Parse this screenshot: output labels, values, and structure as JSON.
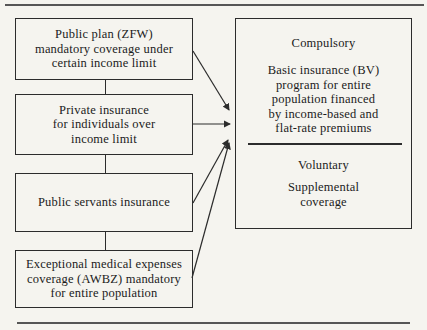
{
  "diagram": {
    "left_boxes": [
      {
        "id": "public-plan-zfw",
        "text": "Public plan (ZFW)\nmandatory coverage under\ncertain income limit"
      },
      {
        "id": "private-insurance",
        "text": "Private insurance\nfor individuals over\nincome limit"
      },
      {
        "id": "public-servants",
        "text": "Public servants insurance"
      },
      {
        "id": "awbz",
        "text": "Exceptional medical expenses\ncoverage (AWBZ) mandatory\nfor entire population"
      }
    ],
    "right_box": {
      "compulsory_label": "Compulsory",
      "compulsory_body": "Basic insurance (BV)\nprogram for entire\npopulation financed\nby income-based and\nflat-rate premiums",
      "voluntary_label": "Voluntary",
      "voluntary_body": "Supplemental\ncoverage"
    },
    "connections": [
      {
        "from": "public-plan-zfw",
        "to": "basic-insurance-bv"
      },
      {
        "from": "private-insurance",
        "to": "basic-insurance-bv"
      },
      {
        "from": "public-servants",
        "to": "basic-insurance-bv"
      },
      {
        "from": "awbz",
        "to": "basic-insurance-bv"
      }
    ],
    "colors": {
      "background": "#f5f4ef",
      "line": "#2c2c2c",
      "text": "#1b1b1b",
      "rule": "#565656"
    }
  }
}
